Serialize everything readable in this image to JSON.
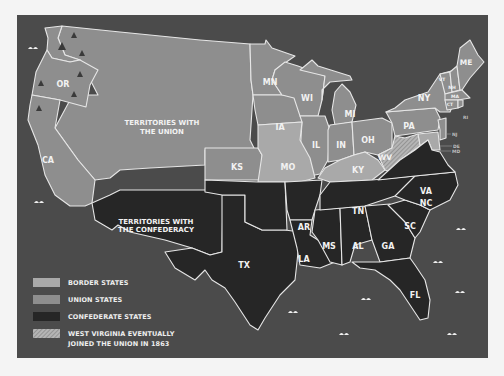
{
  "map": {
    "colors": {
      "background": "#4b4b4b",
      "border_states": "#a9a9a9",
      "union_states": "#8e8e8e",
      "confederate_states": "#262626",
      "state_outline": "#e6e6e6",
      "page": "#f4f4f4"
    },
    "regions": {
      "union_territories": "TERRITORIES WITH",
      "union_territories_2": "THE UNION",
      "confederate_territories": "TERRITORIES WITH",
      "confederate_territories_2": "THE CONFEDERACY"
    },
    "states": {
      "OR": "OR",
      "CA": "CA",
      "KS": "KS",
      "MN": "MN",
      "IA": "IA",
      "WI": "WI",
      "MI": "MI",
      "IL": "IL",
      "IN": "IN",
      "OH": "OH",
      "MO": "MO",
      "KY": "KY",
      "WV": "WV",
      "PA": "PA",
      "NY": "NY",
      "ME": "ME",
      "VT": "VT",
      "NH": "NH",
      "MA": "MA",
      "CT": "CT",
      "RI": "RI",
      "NJ": "NJ",
      "DE": "DE",
      "MD": "MD",
      "VA": "VA",
      "NC": "NC",
      "SC": "SC",
      "GA": "GA",
      "FL": "FL",
      "AL": "AL",
      "MS": "MS",
      "TN": "TN",
      "AR": "AR",
      "LA": "LA",
      "TX": "TX"
    },
    "icons": [
      "tree-icon",
      "wave-icon"
    ]
  },
  "legend": {
    "items": [
      {
        "label": "BORDER STATES",
        "color": "#a9a9a9"
      },
      {
        "label": "UNION STATES",
        "color": "#8e8e8e"
      },
      {
        "label": "CONFEDERATE STATES",
        "color": "#262626"
      },
      {
        "label": "WEST VIRGINIA EVENTUALLY",
        "label2": "JOINED THE UNION IN 1863",
        "color": "hatched"
      }
    ]
  }
}
